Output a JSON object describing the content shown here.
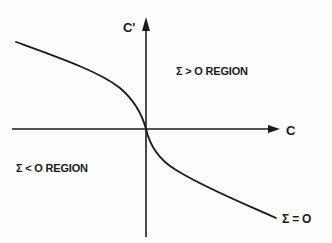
{
  "diagram": {
    "axes": {
      "x_label": "C",
      "y_label": "C'"
    },
    "regions": {
      "positive": "Σ > O  REGION",
      "negative": "Σ < O  REGION"
    },
    "curve": {
      "label": "Σ = O"
    },
    "colors": {
      "ink": "#1a1a1a",
      "background": "#ffffff"
    }
  }
}
